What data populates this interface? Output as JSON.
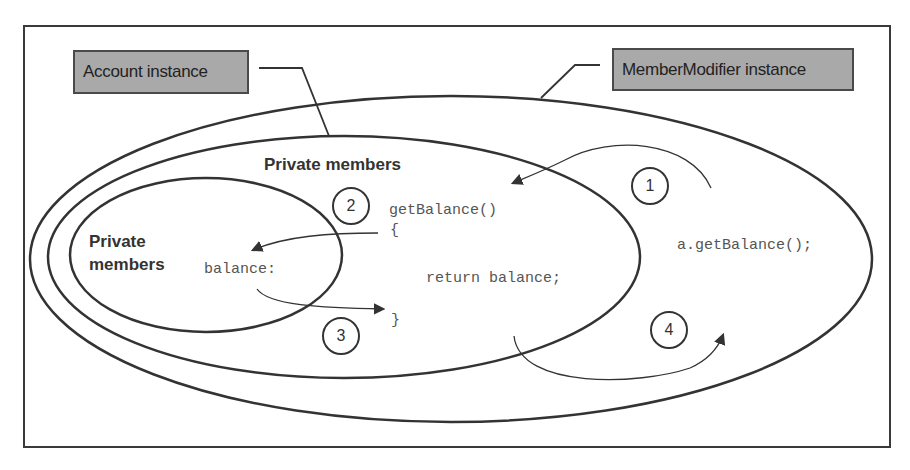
{
  "diagram": {
    "labels": {
      "account_instance": "Account instance",
      "member_modifier_instance": "MemberModifier instance",
      "private_members_account": "Private members",
      "private_members_inner_line1": "Private",
      "private_members_inner_line2": "members"
    },
    "code": {
      "method_signature": "getBalance()",
      "open_brace": "{",
      "return_statement": "return balance;",
      "close_brace": "}",
      "field": "balance:",
      "call": "a.getBalance();"
    },
    "steps": [
      {
        "number": "1",
        "description": "call enters getBalance"
      },
      {
        "number": "2",
        "description": "getBalance accesses balance"
      },
      {
        "number": "3",
        "description": "balance value returned to method"
      },
      {
        "number": "4",
        "description": "result returned to caller"
      }
    ],
    "colors": {
      "label_fill": "#a9a9a9",
      "stroke": "#333333",
      "code_text": "#555555"
    }
  }
}
